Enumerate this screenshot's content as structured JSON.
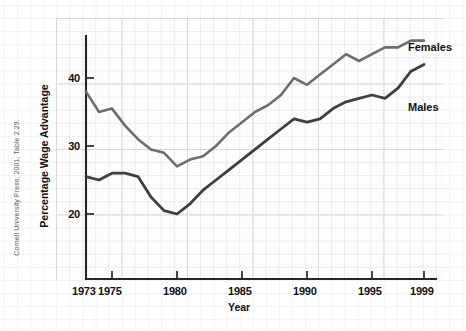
{
  "credit": "Cornell University Press, 2001, Table 2.29.",
  "axes": {
    "x_title": "Year",
    "y_title": "Percentage Wage Advantage",
    "x_ticks": [
      "1973",
      "1975",
      "1980",
      "1985",
      "1990",
      "1995",
      "1999"
    ],
    "y_ticks": [
      "20",
      "30",
      "40"
    ]
  },
  "labels": {
    "females": "Females",
    "males": "Males"
  },
  "colors": {
    "females_line": "#6e6e72",
    "males_line": "#3f3f43",
    "axis": "#26262a",
    "grid_minor": "#e9ebee",
    "grid_major": "#d6d9de",
    "background": "#ffffff"
  },
  "chart_data": {
    "type": "line",
    "title": "",
    "xlabel": "Year",
    "ylabel": "Percentage Wage Advantage",
    "xlim": [
      1973,
      1999
    ],
    "ylim": [
      12,
      49
    ],
    "grid": true,
    "legend": "inline-right-labels",
    "x": [
      1973,
      1974,
      1975,
      1976,
      1977,
      1978,
      1979,
      1980,
      1981,
      1982,
      1983,
      1984,
      1985,
      1986,
      1987,
      1988,
      1989,
      1990,
      1991,
      1992,
      1993,
      1994,
      1995,
      1996,
      1997,
      1998,
      1999
    ],
    "series": [
      {
        "name": "Females",
        "color": "#6e6e72",
        "values": [
          38.0,
          35.0,
          35.5,
          33.0,
          31.0,
          29.5,
          29.0,
          27.0,
          28.0,
          28.5,
          30.0,
          32.0,
          33.5,
          35.0,
          36.0,
          37.5,
          40.0,
          39.0,
          40.5,
          42.0,
          43.5,
          42.5,
          43.5,
          44.5,
          44.5,
          45.5,
          45.5
        ]
      },
      {
        "name": "Males",
        "color": "#3f3f43",
        "values": [
          25.5,
          25.0,
          26.0,
          26.0,
          25.5,
          22.5,
          20.5,
          20.0,
          21.5,
          23.5,
          25.0,
          26.5,
          28.0,
          29.5,
          31.0,
          32.5,
          34.0,
          33.5,
          34.0,
          35.5,
          36.5,
          37.0,
          37.5,
          37.0,
          38.5,
          41.0,
          42.0
        ]
      }
    ]
  }
}
